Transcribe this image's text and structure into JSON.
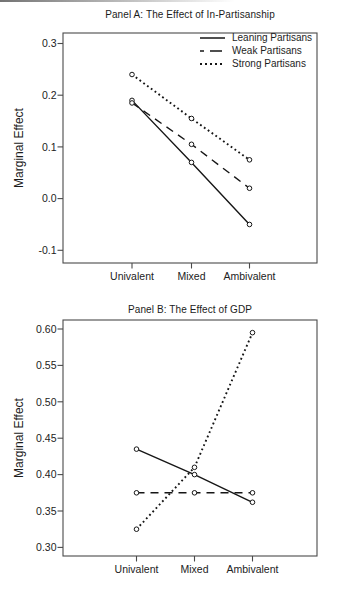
{
  "figure": {
    "background_color": "#ffffff",
    "line_color": "#161616",
    "text_color": "#1b1b1b",
    "frame_color": "#4a4a4a"
  },
  "chart_data": [
    {
      "type": "line",
      "title": "Panel A: The Effect of In-Partisanship",
      "ylabel": "Marginal Effect",
      "xlabel": "",
      "categories": [
        "Univalent",
        "Mixed",
        "Ambivalent"
      ],
      "ytick_labels": [
        "0.3",
        "0.2",
        "0.1",
        "0.0",
        "-0.1"
      ],
      "ytick_values": [
        0.3,
        0.2,
        0.1,
        0.0,
        -0.1
      ],
      "ylim": [
        -0.125,
        0.32
      ],
      "grid": false,
      "marker": "open-circle",
      "legend_position": "top-right-inside",
      "series": [
        {
          "name": "Leaning Partisans",
          "line_style": "solid",
          "values": [
            0.19,
            0.07,
            -0.05
          ]
        },
        {
          "name": "Weak Partisans",
          "line_style": "dashed",
          "values": [
            0.185,
            0.105,
            0.02
          ]
        },
        {
          "name": "Strong Partisans",
          "line_style": "dotted",
          "values": [
            0.24,
            0.155,
            0.075
          ]
        }
      ]
    },
    {
      "type": "line",
      "title": "Panel B: The Effect of GDP",
      "ylabel": "Marginal Effect",
      "xlabel": "",
      "categories": [
        "Univalent",
        "Mixed",
        "Ambivalent"
      ],
      "ytick_labels": [
        "0.60",
        "0.55",
        "0.50",
        "0.45",
        "0.40",
        "0.35",
        "0.30"
      ],
      "ytick_values": [
        0.6,
        0.55,
        0.5,
        0.45,
        0.4,
        0.35,
        0.3
      ],
      "ylim": [
        0.285,
        0.615
      ],
      "grid": false,
      "marker": "open-circle",
      "legend_position": "none",
      "series": [
        {
          "name": "Leaning Partisans",
          "line_style": "solid",
          "values": [
            0.435,
            0.4,
            0.362
          ]
        },
        {
          "name": "Weak Partisans",
          "line_style": "dashed",
          "values": [
            0.375,
            0.375,
            0.375
          ]
        },
        {
          "name": "Strong Partisans",
          "line_style": "dotted",
          "values": [
            0.325,
            0.41,
            0.595
          ]
        }
      ]
    }
  ]
}
